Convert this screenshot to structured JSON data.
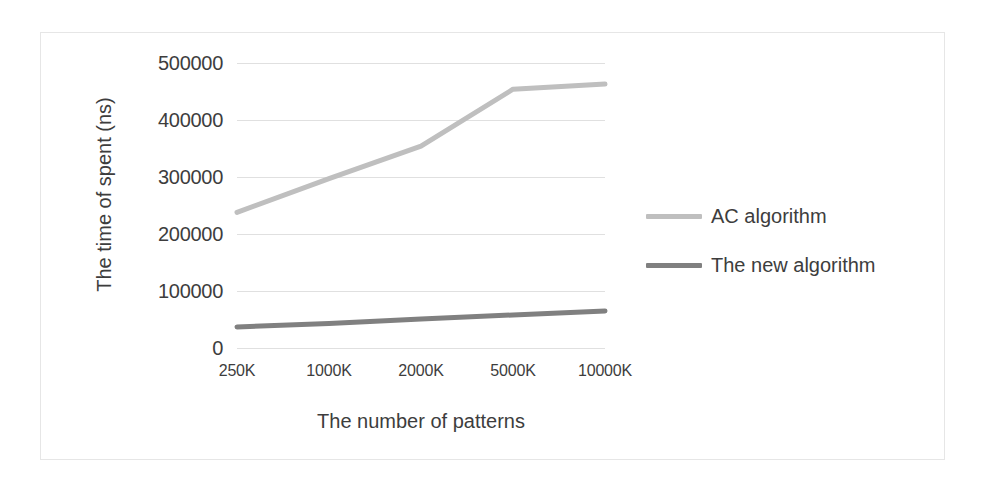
{
  "chart_data": {
    "type": "line",
    "title": "",
    "xlabel": "The number of patterns",
    "ylabel": "The time of spent (ns)",
    "categories": [
      "250K",
      "1000K",
      "2000K",
      "5000K",
      "10000K"
    ],
    "ylim": [
      0,
      500000
    ],
    "y_ticks": [
      0,
      100000,
      200000,
      300000,
      400000,
      500000
    ],
    "y_tick_labels": [
      "0",
      "100000",
      "200000",
      "300000",
      "400000",
      "500000"
    ],
    "grid": true,
    "legend_position": "right",
    "series": [
      {
        "name": "AC algorithm",
        "color": "#bfbfbf",
        "values": [
          238000,
          297000,
          354000,
          454000,
          463000
        ]
      },
      {
        "name": "The new algorithm",
        "color": "#808080",
        "values": [
          37000,
          43000,
          51000,
          58000,
          65000
        ]
      }
    ]
  },
  "legend": {
    "entries": [
      {
        "label": "AC algorithm"
      },
      {
        "label": "The new algorithm"
      }
    ]
  },
  "colors": {
    "ac_algorithm": "#bfbfbf",
    "new_algorithm": "#808080",
    "gridline": "#e0e0e0",
    "frame_border": "#e6e6e6",
    "text": "#3d3d3d"
  }
}
